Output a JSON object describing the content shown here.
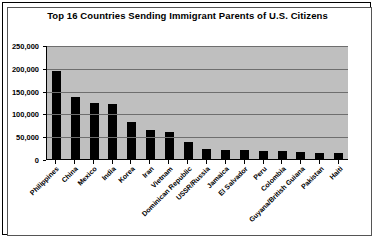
{
  "chart_data": {
    "type": "bar",
    "title": "Top 16 Countries Sending Immigrant Parents of U.S. Citizens",
    "xlabel": "",
    "ylabel": "",
    "ylim": [
      0,
      250000
    ],
    "yticks": [
      0,
      50000,
      100000,
      150000,
      200000,
      250000
    ],
    "ytick_labels": [
      "0",
      "50,000",
      "100,000",
      "150,000",
      "200,000",
      "250,000"
    ],
    "grid": true,
    "legend": "none",
    "categories": [
      "Philippines",
      "China",
      "Mexico",
      "India",
      "Korea",
      "Iran",
      "Vietnam",
      "Dominican Republic",
      "USSR/Russia",
      "Jamaica",
      "El Salvador",
      "Peru",
      "Colombia",
      "Guyana/British Guiana",
      "Pakistan",
      "Haiti"
    ],
    "values": [
      194000,
      136000,
      123000,
      120000,
      82000,
      63000,
      60000,
      38000,
      23000,
      20000,
      19000,
      18000,
      17000,
      16000,
      14000,
      13000
    ],
    "bar_color": "#000000",
    "plot_background": "#bfbfbf"
  }
}
